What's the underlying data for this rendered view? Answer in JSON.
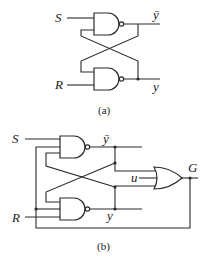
{
  "diagram_a": {
    "caption": "(a)",
    "inputs": [
      "S",
      "R"
    ],
    "outputs": [
      "ȳ",
      "y"
    ],
    "gates": [
      {
        "type": "NAND",
        "inputs": [
          "S",
          "y"
        ],
        "output": "ȳ"
      },
      {
        "type": "NAND",
        "inputs": [
          "ȳ",
          "R"
        ],
        "output": "y"
      }
    ]
  },
  "diagram_b": {
    "caption": "(b)",
    "inputs": [
      "S",
      "R",
      "u"
    ],
    "outputs": [
      "ȳ",
      "y",
      "G"
    ],
    "gates": [
      {
        "type": "NAND",
        "inputs": [
          "S",
          "G",
          "y"
        ],
        "output": "ȳ"
      },
      {
        "type": "NAND",
        "inputs": [
          "ȳ",
          "G",
          "R"
        ],
        "output": "y"
      },
      {
        "type": "OR",
        "inputs": [
          "ȳ",
          "u",
          "y"
        ],
        "output": "G"
      }
    ]
  },
  "labels": {
    "a_S": "S",
    "a_R": "R",
    "a_ybar": "ȳ",
    "a_y": "y",
    "b_S": "S",
    "b_R": "R",
    "b_ybar": "ȳ",
    "b_y": "y",
    "b_u": "u",
    "b_G": "G"
  }
}
